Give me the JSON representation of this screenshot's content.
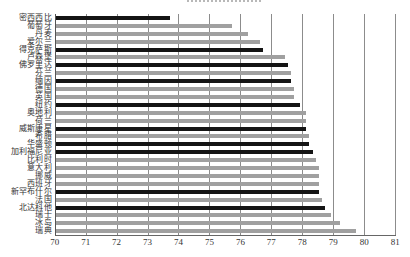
{
  "chart_data": {
    "type": "bar",
    "orientation": "horizontal",
    "title": "",
    "xlabel": "",
    "ylabel": "",
    "xlim": [
      70,
      81
    ],
    "xticks": [
      70,
      71,
      72,
      73,
      74,
      75,
      76,
      77,
      78,
      79,
      80,
      81
    ],
    "grid": "vertical",
    "legend": "none",
    "categories": [
      "密西西比",
      "葡萄牙",
      "丹麦",
      "爱尔兰",
      "得克萨斯",
      "卢森堡",
      "佛罗里达",
      "芬兰",
      "缅因",
      "德国",
      "英国",
      "纽约",
      "奥地利",
      "荷兰",
      "威斯康星",
      "希腊",
      "华盛顿",
      "加利福尼亚",
      "比利时",
      "意大利",
      "挪威",
      "西班牙",
      "新罕布什尔",
      "法国",
      "北达科他",
      "瑞士",
      "冰岛",
      "瑞典"
    ],
    "values": [
      73.7,
      75.7,
      76.2,
      76.6,
      76.7,
      77.4,
      77.5,
      77.6,
      77.6,
      77.7,
      77.7,
      77.9,
      78.1,
      78.1,
      78.1,
      78.2,
      78.2,
      78.3,
      78.4,
      78.5,
      78.5,
      78.5,
      78.5,
      78.6,
      78.7,
      78.9,
      79.2,
      79.7
    ],
    "bar_color_group": [
      "dark",
      "light",
      "light",
      "light",
      "dark",
      "light",
      "dark",
      "light",
      "dark",
      "light",
      "light",
      "dark",
      "light",
      "light",
      "dark",
      "light",
      "dark",
      "dark",
      "light",
      "light",
      "light",
      "light",
      "dark",
      "light",
      "dark",
      "light",
      "light",
      "light"
    ]
  },
  "colors": {
    "dark_bar": "#141414",
    "light_bar": "#a0a0a0",
    "gridline": "#8c8c8c",
    "background": "#ffffff"
  }
}
